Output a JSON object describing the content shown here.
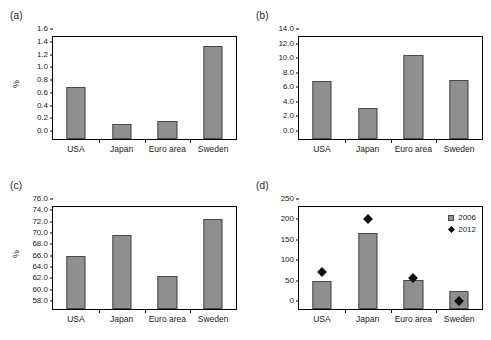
{
  "figure": {
    "background": "#ffffff",
    "bar_color": "#8f8f8f",
    "bar_edge_color": "#4a4a4a",
    "marker_color": "#111111",
    "axis_color": "#000000"
  },
  "panels": [
    {
      "label": "(a)",
      "ylabel": "%",
      "has_legend": false,
      "chart_data": {
        "type": "bar",
        "title": "",
        "xlabel": "",
        "ylabel": "%",
        "categories": [
          "USA",
          "Japan",
          "Euro area",
          "Sweden"
        ],
        "values": [
          0.82,
          0.23,
          0.28,
          1.46
        ],
        "ylim": [
          0.0,
          1.6
        ],
        "yticks": [
          "0.0",
          "0.2",
          "0.4",
          "0.6",
          "0.8",
          "1.0",
          "1.2",
          "1.4",
          "1.6"
        ],
        "ytick_values": [
          0.0,
          0.2,
          0.4,
          0.6,
          0.8,
          1.0,
          1.2,
          1.4,
          1.6
        ],
        "grid": false,
        "legend": null
      }
    },
    {
      "label": "(b)",
      "ylabel": "",
      "has_legend": false,
      "chart_data": {
        "type": "bar",
        "title": "",
        "xlabel": "",
        "ylabel": "",
        "categories": [
          "USA",
          "Japan",
          "Euro area",
          "Sweden"
        ],
        "values": [
          7.9,
          4.3,
          11.5,
          8.1
        ],
        "ylim": [
          0.0,
          14.0
        ],
        "yticks": [
          "0.0",
          "2.0",
          "4.0",
          "6.0",
          "8.0",
          "10.0",
          "12.0",
          "14.0"
        ],
        "ytick_values": [
          0.0,
          2.0,
          4.0,
          6.0,
          8.0,
          10.0,
          12.0,
          14.0
        ],
        "grid": false,
        "legend": null
      }
    },
    {
      "label": "(c)",
      "ylabel": "%",
      "has_legend": false,
      "chart_data": {
        "type": "bar",
        "title": "",
        "xlabel": "",
        "ylabel": "%",
        "categories": [
          "USA",
          "Japan",
          "Euro area",
          "Sweden"
        ],
        "values": [
          67.4,
          71.0,
          63.9,
          73.8
        ],
        "ylim": [
          58.0,
          76.0
        ],
        "yticks": [
          "58.0",
          "60.0",
          "62.0",
          "64.0",
          "66.0",
          "68.0",
          "70.0",
          "72.0",
          "74.0",
          "76.0"
        ],
        "ytick_values": [
          58.0,
          60.0,
          62.0,
          64.0,
          66.0,
          68.0,
          70.0,
          72.0,
          74.0,
          76.0
        ],
        "grid": false,
        "legend": null
      }
    },
    {
      "label": "(d)",
      "ylabel": "",
      "has_legend": true,
      "chart_data": {
        "type": "bar",
        "title": "",
        "xlabel": "",
        "ylabel": "",
        "categories": [
          "USA",
          "Japan",
          "Euro area",
          "Sweden"
        ],
        "series": [
          {
            "name": "2006",
            "kind": "bar",
            "values": [
              68,
              186,
              70,
              45
            ]
          },
          {
            "name": "2012",
            "kind": "scatter",
            "values": [
              108,
              237,
              93,
              38
            ]
          }
        ],
        "ylim": [
          0,
          250
        ],
        "yticks": [
          "0",
          "50",
          "100",
          "150",
          "200",
          "250"
        ],
        "ytick_values": [
          0,
          50,
          100,
          150,
          200,
          250
        ],
        "grid": false,
        "legend": {
          "position": "top-right",
          "entries": [
            {
              "label": "2006",
              "marker": "square",
              "color": "#8f8f8f"
            },
            {
              "label": "2012",
              "marker": "diamond",
              "color": "#111111"
            }
          ]
        }
      }
    }
  ]
}
